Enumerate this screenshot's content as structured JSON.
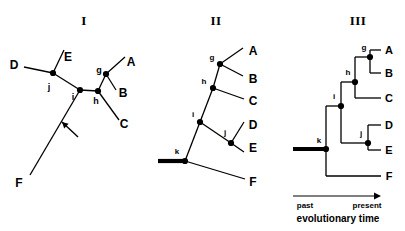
{
  "figure": {
    "caption_axis": {
      "past_label": "past",
      "present_label": "present",
      "axis_title": "evolutionary time"
    },
    "panels": [
      {
        "id": "panel-I",
        "title": "I",
        "title_pos": [
          84,
          20
        ],
        "style": "unrooted",
        "tips": [
          {
            "label": "D",
            "x": 14,
            "y": 65
          },
          {
            "label": "E",
            "x": 68,
            "y": 57
          },
          {
            "label": "A",
            "x": 131,
            "y": 62
          },
          {
            "label": "B",
            "x": 123,
            "y": 93
          },
          {
            "label": "C",
            "x": 124,
            "y": 124
          },
          {
            "label": "F",
            "x": 19,
            "y": 183
          }
        ],
        "nodes": [
          {
            "label": "j",
            "x": 53,
            "y": 73,
            "lx": 49,
            "ly": 87
          },
          {
            "label": "i",
            "x": 80,
            "y": 90,
            "lx": 73,
            "ly": 97
          },
          {
            "label": "h",
            "x": 98,
            "y": 91,
            "lx": 96,
            "ly": 101
          },
          {
            "label": "g",
            "x": 106,
            "y": 74,
            "lx": 99,
            "ly": 70
          }
        ],
        "edges": [
          [
            24,
            67,
            53,
            73
          ],
          [
            53,
            73,
            64,
            50
          ],
          [
            53,
            73,
            80,
            90
          ],
          [
            80,
            90,
            98,
            91
          ],
          [
            98,
            91,
            106,
            74
          ],
          [
            106,
            74,
            125,
            57
          ],
          [
            106,
            74,
            116,
            90
          ],
          [
            98,
            91,
            119,
            120
          ],
          [
            80,
            90,
            30,
            175
          ]
        ],
        "annotation_arrow": {
          "from": [
            78,
            137
          ],
          "to": [
            62,
            122
          ]
        }
      },
      {
        "id": "panel-II",
        "title": "II",
        "title_pos": [
          216,
          20
        ],
        "style": "rooted-slanted",
        "tips": [
          {
            "label": "A",
            "x": 253,
            "y": 51
          },
          {
            "label": "B",
            "x": 253,
            "y": 79
          },
          {
            "label": "C",
            "x": 253,
            "y": 101
          },
          {
            "label": "D",
            "x": 253,
            "y": 125
          },
          {
            "label": "E",
            "x": 253,
            "y": 148
          },
          {
            "label": "F",
            "x": 253,
            "y": 182
          }
        ],
        "nodes": [
          {
            "label": "g",
            "x": 220,
            "y": 64,
            "lx": 212,
            "ly": 58
          },
          {
            "label": "h",
            "x": 213,
            "y": 88,
            "lx": 204,
            "ly": 82
          },
          {
            "label": "i",
            "x": 200,
            "y": 122,
            "lx": 193,
            "ly": 115
          },
          {
            "label": "j",
            "x": 231,
            "y": 143,
            "lx": 225,
            "ly": 133
          },
          {
            "label": "k",
            "x": 185,
            "y": 161,
            "lx": 177,
            "ly": 152
          }
        ],
        "edges": [
          [
            220,
            64,
            243,
            48
          ],
          [
            220,
            64,
            243,
            76
          ],
          [
            213,
            88,
            220,
            64
          ],
          [
            213,
            88,
            244,
            99
          ],
          [
            200,
            122,
            213,
            88
          ],
          [
            200,
            122,
            231,
            143
          ],
          [
            231,
            143,
            244,
            122
          ],
          [
            231,
            143,
            244,
            152
          ],
          [
            185,
            161,
            200,
            122
          ],
          [
            185,
            161,
            245,
            179
          ]
        ],
        "root_stem": [
          158,
          161,
          185,
          161
        ]
      },
      {
        "id": "panel-III",
        "title": "III",
        "title_pos": [
          358,
          20
        ],
        "style": "rooted-rectangular",
        "tips": [
          {
            "label": "A",
            "x": 389,
            "y": 50
          },
          {
            "label": "B",
            "x": 389,
            "y": 73
          },
          {
            "label": "C",
            "x": 389,
            "y": 98
          },
          {
            "label": "D",
            "x": 389,
            "y": 125
          },
          {
            "label": "E",
            "x": 389,
            "y": 150
          },
          {
            "label": "F",
            "x": 389,
            "y": 176
          }
        ],
        "nodes": [
          {
            "label": "g",
            "x": 370,
            "y": 57,
            "lx": 364,
            "ly": 48
          },
          {
            "label": "h",
            "x": 355,
            "y": 82,
            "lx": 348,
            "ly": 73
          },
          {
            "label": "i",
            "x": 341,
            "y": 106,
            "lx": 334,
            "ly": 97
          },
          {
            "label": "j",
            "x": 368,
            "y": 143,
            "lx": 361,
            "ly": 134
          },
          {
            "label": "k",
            "x": 326,
            "y": 149,
            "lx": 319,
            "ly": 141
          }
        ],
        "edges": [
          [
            370,
            50,
            381,
            50
          ],
          [
            370,
            73,
            381,
            73
          ],
          [
            370,
            50,
            370,
            73
          ],
          [
            355,
            57,
            370,
            57
          ],
          [
            355,
            98,
            381,
            98
          ],
          [
            355,
            57,
            355,
            98
          ],
          [
            341,
            82,
            355,
            82
          ],
          [
            368,
            125,
            381,
            125
          ],
          [
            368,
            150,
            381,
            150
          ],
          [
            368,
            125,
            368,
            150
          ],
          [
            341,
            143,
            368,
            143
          ],
          [
            341,
            82,
            341,
            143
          ],
          [
            326,
            106,
            341,
            106
          ],
          [
            326,
            176,
            381,
            176
          ],
          [
            326,
            106,
            326,
            176
          ]
        ],
        "root_stem": [
          293,
          149,
          326,
          149
        ],
        "time_axis": {
          "x1": 293,
          "x2": 381,
          "y": 196
        },
        "past_pos": [
          305,
          206
        ],
        "present_pos": [
          367,
          206
        ],
        "axis_title_pos": [
          338,
          219
        ]
      }
    ]
  }
}
